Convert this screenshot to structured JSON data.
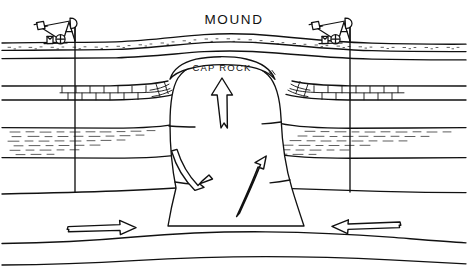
{
  "diagram": {
    "title": "MOUND",
    "caprock_label": "CAP ROCK",
    "background_color": "#ffffff",
    "ink_color": "#111111",
    "labels": {
      "mound": "MOUND",
      "cap_rock": "CAP ROCK"
    },
    "features": {
      "left_pumpjack": "oil-pumpjack",
      "right_pumpjack": "oil-pumpjack",
      "left_wellbore": "vertical-well-line",
      "right_wellbore": "vertical-well-line",
      "salt_dome": "salt-dome-intrusion",
      "cap_rock": "cap-rock-cover",
      "soil_layer": "stippled-soil-surface",
      "limestone_layer": "brick-pattern-limestone",
      "sand_layer": "dashed-sand-shale",
      "deep_strata": "lower-sedimentary-beds"
    },
    "arrows": {
      "dome_center": "up-arrow",
      "dome_left": "curved-up-arrow",
      "dome_right": "curved-up-arrow",
      "basin_left": "right-arrow",
      "basin_right": "left-arrow"
    },
    "arrow_count": 5,
    "stratum_count": 4
  }
}
